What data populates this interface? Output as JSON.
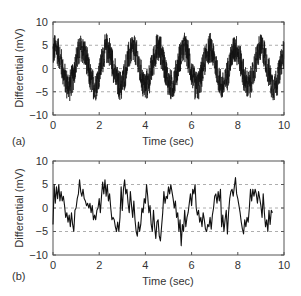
{
  "chart_data": [
    {
      "panel": "(a)",
      "type": "line",
      "title": "",
      "xlabel": "Time (sec)",
      "ylabel": "Differential (mV)",
      "xlim": [
        0,
        10
      ],
      "ylim": [
        -10,
        10
      ],
      "xticks": [
        0,
        2,
        4,
        6,
        8,
        10
      ],
      "yticks": [
        -10,
        -5,
        0,
        5,
        10
      ],
      "grid": "dashed horizontal lines at y = -5, 0, 5",
      "grid_lines_y": [
        -5,
        0,
        5
      ],
      "description": "Dense noisy signal: ~0.9 Hz sinusoid (period ~1.1 s, amplitude ~4 mV) plus high-frequency noise (~±4 mV); peaks reach ~9, troughs ~-9",
      "series": [
        {
          "name": "raw differential signal",
          "color": "#000000",
          "model": {
            "freq_hz": 0.9,
            "amplitude": 4.0,
            "phase": 0.9,
            "offset": 0.3,
            "noise_amp": 3.8,
            "samples": 2000
          },
          "sinusoid_peaks_x": [
            0.25,
            1.3,
            2.3,
            3.3,
            4.3,
            5.3,
            6.3,
            7.3,
            8.3,
            9.3
          ],
          "sinusoid_troughs_x": [
            0.75,
            1.8,
            2.8,
            3.8,
            4.8,
            5.8,
            6.8,
            7.8,
            8.8,
            9.8
          ]
        }
      ]
    },
    {
      "panel": "(b)",
      "type": "line",
      "title": "",
      "xlabel": "Time (sec)",
      "ylabel": "Differential (mV)",
      "xlim": [
        0,
        10
      ],
      "ylim": [
        -10,
        10
      ],
      "xticks": [
        0,
        2,
        4,
        6,
        8,
        10
      ],
      "yticks": [
        -10,
        -5,
        0,
        5,
        10
      ],
      "grid_lines_y": [
        -5,
        0,
        5
      ],
      "series": [
        {
          "name": "filtered differential signal",
          "color": "#000000",
          "x": [
            0.0,
            0.05,
            0.1,
            0.15,
            0.2,
            0.25,
            0.3,
            0.35,
            0.4,
            0.45,
            0.5,
            0.55,
            0.6,
            0.65,
            0.7,
            0.75,
            0.8,
            0.85,
            0.9,
            0.95,
            1.0,
            1.05,
            1.1,
            1.15,
            1.2,
            1.25,
            1.3,
            1.35,
            1.4,
            1.45,
            1.5,
            1.55,
            1.6,
            1.65,
            1.7,
            1.75,
            1.8,
            1.85,
            1.9,
            1.95,
            2.0,
            2.05,
            2.1,
            2.15,
            2.2,
            2.25,
            2.3,
            2.35,
            2.4,
            2.45,
            2.5,
            2.55,
            2.6,
            2.65,
            2.7,
            2.75,
            2.8,
            2.85,
            2.9,
            2.95,
            3.0,
            3.05,
            3.1,
            3.15,
            3.2,
            3.25,
            3.3,
            3.35,
            3.4,
            3.45,
            3.5,
            3.55,
            3.6,
            3.65,
            3.7,
            3.75,
            3.8,
            3.85,
            3.9,
            3.95,
            4.0,
            4.05,
            4.1,
            4.15,
            4.2,
            4.25,
            4.3,
            4.35,
            4.4,
            4.45,
            4.5,
            4.55,
            4.6,
            4.65,
            4.7,
            4.75,
            4.8,
            4.85,
            4.9,
            4.95,
            5.0,
            5.05,
            5.1,
            5.15,
            5.2,
            5.25,
            5.3,
            5.35,
            5.4,
            5.45,
            5.5,
            5.55,
            5.6,
            5.65,
            5.7,
            5.75,
            5.8,
            5.85,
            5.9,
            5.95,
            6.0,
            6.05,
            6.1,
            6.15,
            6.2,
            6.25,
            6.3,
            6.35,
            6.4,
            6.45,
            6.5,
            6.55,
            6.6,
            6.65,
            6.7,
            6.75,
            6.8,
            6.85,
            6.9,
            6.95,
            7.0,
            7.05,
            7.1,
            7.15,
            7.2,
            7.25,
            7.3,
            7.35,
            7.4,
            7.45,
            7.5,
            7.55,
            7.6,
            7.65,
            7.7,
            7.75,
            7.8,
            7.85,
            7.9,
            7.95,
            8.0,
            8.05,
            8.1,
            8.15,
            8.2,
            8.25,
            8.3,
            8.35,
            8.4,
            8.45,
            8.5,
            8.55,
            8.6,
            8.65,
            8.7,
            8.75,
            8.8,
            8.85,
            8.9,
            8.95,
            9.0,
            9.05,
            9.1,
            9.15,
            9.2,
            9.25,
            9.3,
            9.35,
            9.4,
            9.45,
            9.5,
            9.55,
            9.6,
            9.65,
            9.7,
            9.75,
            9.8,
            9.85,
            9.9,
            9.95,
            10.0
          ],
          "y": [
            -3.5,
            5.0,
            1.0,
            4.5,
            2.0,
            5.0,
            1.5,
            3.5,
            1.5,
            2.5,
            0.5,
            -2.0,
            -1.0,
            -3.0,
            -1.5,
            -4.0,
            -1.0,
            -3.5,
            -5.0,
            -0.5,
            0.0,
            2.0,
            3.0,
            6.0,
            3.5,
            2.5,
            4.0,
            2.0,
            1.5,
            0.5,
            1.0,
            0.0,
            1.0,
            -1.0,
            0.5,
            -2.5,
            -1.5,
            -2.5,
            -0.5,
            0.0,
            2.0,
            -1.0,
            2.5,
            5.5,
            3.0,
            6.0,
            2.5,
            5.0,
            1.5,
            3.0,
            0.0,
            -2.5,
            -2.0,
            -2.5,
            -4.0,
            -5.0,
            -3.0,
            -5.0,
            -2.0,
            4.5,
            -0.5,
            4.0,
            6.0,
            3.0,
            4.0,
            1.0,
            -1.0,
            3.5,
            0.5,
            -2.0,
            1.5,
            -2.5,
            -5.0,
            -6.0,
            -3.0,
            -5.0,
            -3.5,
            0.0,
            -1.0,
            2.0,
            1.0,
            5.0,
            2.5,
            -1.0,
            0.5,
            -3.5,
            -5.0,
            -0.5,
            -4.0,
            -6.5,
            -3.0,
            -2.5,
            -6.0,
            -7.0,
            -4.0,
            -1.0,
            3.5,
            1.0,
            2.5,
            2.0,
            4.5,
            3.0,
            5.0,
            3.5,
            2.0,
            0.0,
            1.5,
            -2.0,
            -1.0,
            -5.0,
            -2.5,
            -8.0,
            -3.5,
            -5.0,
            -0.5,
            -4.0,
            -2.0,
            -1.0,
            1.0,
            3.0,
            0.5,
            4.0,
            3.0,
            5.0,
            0.0,
            -1.5,
            -0.5,
            -3.0,
            -2.0,
            -4.0,
            -1.0,
            -2.5,
            -4.5,
            -5.0,
            -3.5,
            -4.0,
            -2.0,
            -4.5,
            -1.5,
            0.0,
            2.5,
            3.0,
            1.0,
            3.5,
            1.5,
            4.0,
            -4.0,
            -1.5,
            -5.0,
            -2.5,
            -0.5,
            -5.5,
            -1.0,
            2.0,
            3.5,
            4.0,
            2.5,
            4.5,
            6.5,
            3.0,
            2.0,
            0.5,
            -1.0,
            -3.0,
            -4.5,
            -5.5,
            -2.5,
            -4.0,
            -2.0,
            -3.0,
            0.0,
            4.0,
            1.5,
            4.0,
            2.5,
            4.0,
            3.0,
            1.0,
            3.5,
            2.0,
            0.5,
            -2.0,
            3.0,
            -1.0,
            -4.0,
            -2.5,
            -5.0,
            -0.5,
            -3.5,
            -0.5,
            -1.0
          ]
        }
      ]
    }
  ],
  "panels": {
    "a": {
      "label": "(a)",
      "ylabel": "Differential (mV)",
      "xlabel": "Time (sec)",
      "yticks": [
        "10",
        "5",
        "0",
        "−5",
        "−10"
      ],
      "xticks": [
        "0",
        "2",
        "4",
        "6",
        "8",
        "10"
      ]
    },
    "b": {
      "label": "(b)",
      "ylabel": "Differential (mV)",
      "xlabel": "Time (sec)",
      "yticks": [
        "10",
        "5",
        "0",
        "−5",
        "−10"
      ],
      "xticks": [
        "0",
        "2",
        "4",
        "6",
        "8",
        "10"
      ]
    }
  },
  "colors": {
    "line": "#111111",
    "axis": "#555555",
    "grid": "#999999"
  }
}
